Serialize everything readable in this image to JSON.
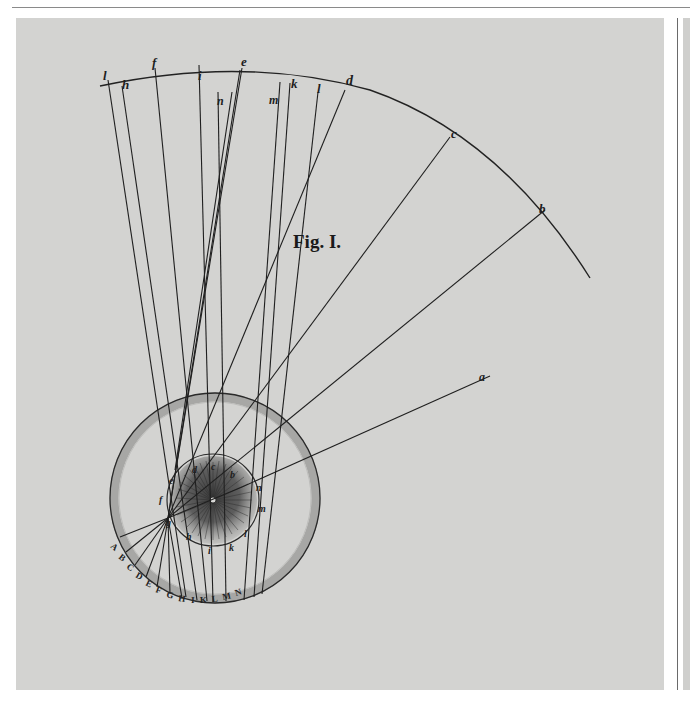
{
  "figure": {
    "caption": "Fig. I.",
    "arc_labels": [
      "l",
      "h",
      "f",
      "i",
      "e",
      "k",
      "l",
      "d",
      "c",
      "b"
    ],
    "inner_labels_top": [
      "n",
      "m"
    ],
    "ray_end_label": "a",
    "lens_labels": [
      "e",
      "d",
      "c",
      "b",
      "n",
      "m",
      "f",
      "g",
      "h",
      "i",
      "k",
      "l"
    ],
    "retina_letters": "A B C D E F G H I K L M N",
    "colors": {
      "plate": "#d3d3d1",
      "ink": "#1e1e1e",
      "ring_shade": "#a9a9a7",
      "lens_shade": "#5a5a5a"
    }
  }
}
